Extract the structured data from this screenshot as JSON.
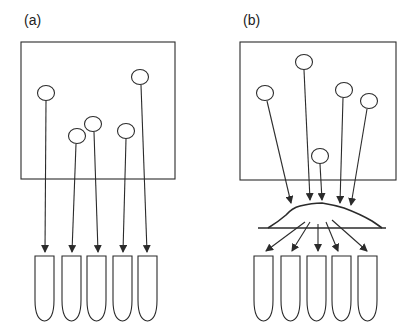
{
  "panels": [
    {
      "id": "a",
      "label": "(a)"
    },
    {
      "id": "b",
      "label": "(b)"
    }
  ],
  "colors": {
    "stroke": "#2b2b2b",
    "background": "#ffffff"
  },
  "diagram": {
    "panel_a": {
      "particles": 5,
      "tubes": 5,
      "flow": "direct"
    },
    "panel_b": {
      "particles": 5,
      "tubes": 5,
      "flow": "pooled-then-distributed",
      "intermediate": "mound"
    }
  }
}
